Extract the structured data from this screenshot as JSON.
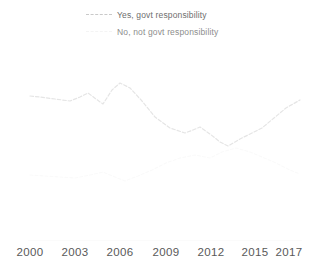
{
  "legend": {
    "position": "top-center",
    "items": [
      {
        "label": "Yes, govt responsibility",
        "color": "#c9c9c9",
        "style": "dashed"
      },
      {
        "label": "No, not govt responsibility",
        "color": "#f4f4f4",
        "style": "dashed"
      }
    ]
  },
  "axis": {
    "x_tick_labels": [
      "2000",
      "2003",
      "2006",
      "2009",
      "2012",
      "2015",
      "2017"
    ]
  },
  "chart_data": {
    "type": "line",
    "title": "",
    "subtitle": "",
    "xlabel": "",
    "ylabel": "",
    "xlim": [
      2000,
      2017
    ],
    "ylim": [
      0,
      100
    ],
    "grid": false,
    "legend_position": "top-center",
    "x": [
      2000,
      2001,
      2002,
      2003,
      2004,
      2005,
      2006,
      2007,
      2008,
      2009,
      2010,
      2011,
      2012,
      2013,
      2014,
      2015,
      2016,
      2017
    ],
    "tick_labels": [
      "2000",
      "2003",
      "2006",
      "2009",
      "2012",
      "2015",
      "2017"
    ],
    "series": [
      {
        "name": "Yes, govt responsibility",
        "color": "#e5e5e5",
        "style": "dashed",
        "values": [
          64,
          62,
          61,
          59,
          59,
          63,
          58,
          69,
          64,
          57,
          50,
          47,
          48,
          44,
          41,
          47,
          51,
          57
        ]
      },
      {
        "name": "No, not govt responsibility",
        "color": "#fafafa",
        "style": "dashed",
        "values": [
          31,
          33,
          34,
          36,
          36,
          33,
          38,
          28,
          32,
          38,
          46,
          48,
          47,
          52,
          54,
          50,
          45,
          39
        ]
      }
    ],
    "pixel_path_yes": "30,96 40,97 55,99 70,101 80,97 88,93 96,99 103,104 112,90 120,83 130,88 142,101 155,117 170,128 185,133 193,130 200,127 210,134 220,142 228,146 240,139 252,133 262,128 274,118 286,108 300,100",
    "pixel_path_no": "30,175 45,176 60,177 75,178 90,175 103,172 115,177 125,181 138,176 152,170 166,163 180,158 195,155 210,158 222,152 236,148 250,152 262,157 276,163 290,170 300,174"
  }
}
